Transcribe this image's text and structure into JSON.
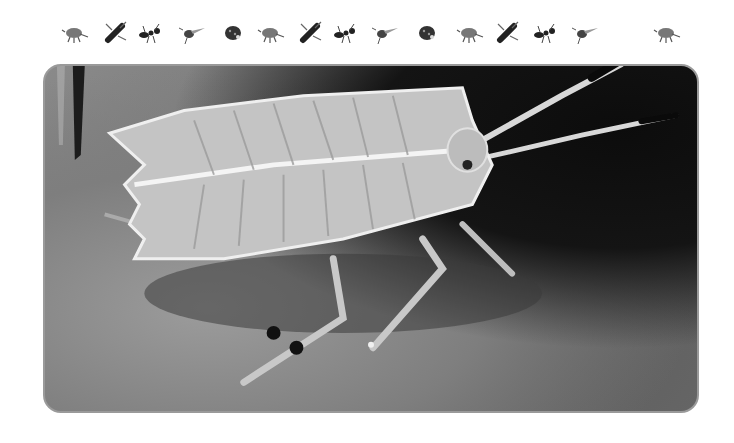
{
  "border": {
    "icons": [
      {
        "name": "beetle-icon",
        "x": 60
      },
      {
        "name": "wasp-icon",
        "x": 100
      },
      {
        "name": "ant-icon",
        "x": 135
      },
      {
        "name": "fly-icon",
        "x": 177
      },
      {
        "name": "ladybug-icon",
        "x": 218
      },
      {
        "name": "beetle-icon",
        "x": 256
      },
      {
        "name": "wasp-icon",
        "x": 295
      },
      {
        "name": "ant-icon",
        "x": 330
      },
      {
        "name": "fly-icon",
        "x": 370
      },
      {
        "name": "ladybug-icon",
        "x": 412
      },
      {
        "name": "beetle-icon",
        "x": 455
      },
      {
        "name": "wasp-icon",
        "x": 492
      },
      {
        "name": "ant-icon",
        "x": 530
      },
      {
        "name": "fly-icon",
        "x": 570
      },
      {
        "name": "beetle-icon",
        "x": 652
      }
    ]
  },
  "photo": {
    "subject": "shield bug nymph on rock",
    "tone": "grayscale",
    "frame_color": "#9a9a9a",
    "background_dark": "#111111",
    "body_color": "#cfcfcf"
  }
}
